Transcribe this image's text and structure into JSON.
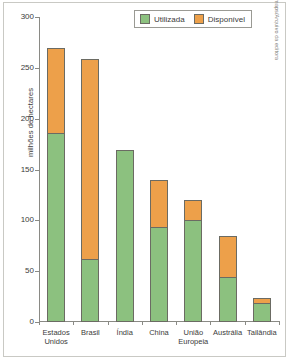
{
  "chart_data": {
    "type": "bar",
    "title": "",
    "subtitle": "",
    "xlabel": "",
    "ylabel": "milhões de hectares",
    "ylim": [
      0,
      300
    ],
    "yticks": [
      0,
      50,
      100,
      150,
      200,
      250,
      300
    ],
    "ytick_labels": [
      "0",
      "50",
      "100",
      "150",
      "200",
      "250",
      "300"
    ],
    "grid": false,
    "stacked": true,
    "legend_position": "top-right",
    "categories": [
      "Estados\nUnidos",
      "Brasil",
      "Índia",
      "China",
      "União\nEuropeia",
      "Austrália",
      "Tailândia"
    ],
    "series": [
      {
        "name": "Utilizada",
        "color": "#8cc17f",
        "values": [
          186,
          62,
          169,
          93,
          100,
          44,
          19
        ]
      },
      {
        "name": "Disponível",
        "color": "#eda04a",
        "values": [
          84,
          197,
          0,
          47,
          20,
          41,
          5
        ]
      }
    ],
    "totals": [
      270,
      259,
      169,
      140,
      120,
      85,
      24
    ]
  },
  "legend": {
    "entries": [
      {
        "label": "Utilizada",
        "swatch": "legend-swatch-used"
      },
      {
        "label": "Disponível",
        "swatch": "legend-swatch-available"
      }
    ]
  },
  "credit": {
    "text": "Allmaps/Arquivo da editora"
  },
  "colors": {
    "used": "#8cc17f",
    "available": "#eda04a",
    "outline": "#6b6b63",
    "axis": "#8a8a85",
    "text": "#3b3b3b",
    "frame": "#c9c9c4"
  }
}
